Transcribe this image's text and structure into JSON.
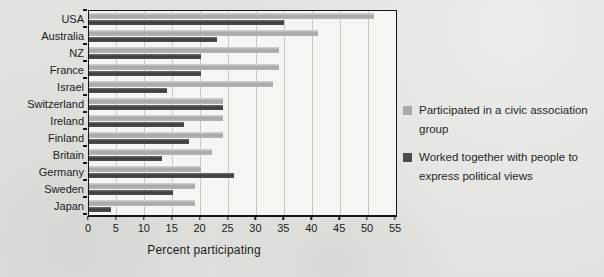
{
  "chart_data": {
    "type": "bar",
    "orientation": "horizontal",
    "title": "",
    "xlabel": "Percent participating",
    "xlim": [
      0,
      55
    ],
    "xticks": [
      0,
      5,
      10,
      15,
      20,
      25,
      30,
      35,
      40,
      45,
      50,
      55
    ],
    "grid": true,
    "legend_position": "right",
    "categories": [
      "USA",
      "Australia",
      "NZ",
      "France",
      "Israel",
      "Switzerland",
      "Ireland",
      "Finland",
      "Britain",
      "Germany",
      "Sweden",
      "Japan"
    ],
    "series": [
      {
        "name": "Participated in a civic association group",
        "color": "#a9a9a9",
        "values": [
          51,
          41,
          34,
          34,
          33,
          24,
          24,
          24,
          22,
          20,
          19,
          19
        ]
      },
      {
        "name": "Worked together with people to express political views",
        "color": "#4c4c4c",
        "values": [
          35,
          23,
          20,
          20,
          14,
          24,
          17,
          18,
          13,
          26,
          15,
          4
        ]
      }
    ]
  },
  "colors": {
    "background": "#e2e2df",
    "plot_background": "#f5f5f2",
    "gridline": "#c9c9c4",
    "axis": "#161616",
    "series_light": "#a9a9a9",
    "series_dark": "#4c4c4c"
  }
}
